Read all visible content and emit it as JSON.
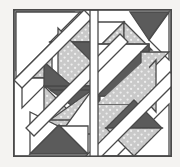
{
  "artwork": {
    "title": "Geometric patchwork quilt block",
    "type": "abstract-geometric-tiling",
    "canvas": {
      "width": 180,
      "height": 167
    },
    "background_color": "#f4f3f1",
    "frame": {
      "x": 13,
      "y": 9,
      "width": 159,
      "height": 148,
      "fill": "#ffffff",
      "stroke": "#4a4a4a",
      "stroke_width": 1.6
    },
    "palette": {
      "white": "#ffffff",
      "speckled_gray": "#c9c9c9",
      "speckle_dot": "#f0f0f0",
      "dark_gray": "#5b5b5b",
      "outline": "#4a4a4a",
      "background": "#f4f3f1"
    },
    "shapes": [
      {
        "id": "s01",
        "name": "top-left-corner-white-triangle",
        "fill": "white",
        "points": "18,14 74,14 18,70"
      },
      {
        "id": "s02",
        "name": "upper-left-speckled-triangle",
        "fill": "speckled",
        "points": "22,76 50,48 50,76"
      },
      {
        "id": "s03",
        "name": "upper-left-white-triangle",
        "fill": "white",
        "points": "22,76 50,76 22,104"
      },
      {
        "id": "s04",
        "name": "top-diamond-speckled-upper",
        "fill": "speckled",
        "points": "80,13 108,41 52,41"
      },
      {
        "id": "s05",
        "name": "top-diamond-dark-lower",
        "fill": "dark",
        "points": "52,41 108,41 80,69"
      },
      {
        "id": "s06",
        "name": "top-center-speckled-triangle",
        "fill": "speckled",
        "points": "98,48 126,20 126,48"
      },
      {
        "id": "s07",
        "name": "top-center-white-wedge",
        "fill": "white",
        "points": "98,48 126,48 98,20"
      },
      {
        "id": "s08",
        "name": "top-right-dark-triangle",
        "fill": "dark",
        "points": "131,13 167,13 149,40"
      },
      {
        "id": "s09",
        "name": "top-right-white-triangle",
        "fill": "white",
        "points": "149,40 167,13 167,58"
      },
      {
        "id": "s10",
        "name": "right-upper-speckled-triangle",
        "fill": "speckled",
        "points": "141,50 167,50 141,76"
      },
      {
        "id": "s11",
        "name": "center-left-speckled-triangle",
        "fill": "speckled",
        "points": "58,83 114,83 58,27"
      },
      {
        "id": "s12",
        "name": "center-left-dark-band",
        "fill": "dark",
        "points": "44,83 100,83 100,110"
      },
      {
        "id": "s13",
        "name": "center-lower-speckled-triangle",
        "fill": "speckled",
        "points": "44,83 44,122 83,122"
      },
      {
        "id": "s14",
        "name": "center-block-white-half",
        "fill": "white",
        "points": "99,44 148,44 99,93"
      },
      {
        "id": "s15",
        "name": "center-block-dark-half",
        "fill": "dark",
        "points": "99,93 148,44 148,93"
      },
      {
        "id": "s16",
        "name": "right-mid-speckled-triangle",
        "fill": "speckled",
        "points": "155,60 155,110 134,85"
      },
      {
        "id": "s17",
        "name": "lower-right-speckled-band",
        "fill": "speckled",
        "points": "99,100 148,100 99,149"
      },
      {
        "id": "s18",
        "name": "lower-right-diamond-dark",
        "fill": "dark",
        "points": "106,126 134,98 162,126"
      },
      {
        "id": "s19",
        "name": "lower-right-diamond-speckled",
        "fill": "speckled",
        "points": "106,126 162,126 134,154"
      },
      {
        "id": "s20",
        "name": "bottom-left-dark-triangle",
        "fill": "dark",
        "points": "32,152 88,152 60,124"
      },
      {
        "id": "s21",
        "name": "bottom-left-white-triangle",
        "fill": "white",
        "points": "32,152 32,110 60,124"
      },
      {
        "id": "s22",
        "name": "lower-left-dark-wedge",
        "fill": "dark",
        "points": "50,88 92,88 92,118"
      },
      {
        "id": "s23",
        "name": "lower-left-speckled-wedge",
        "fill": "speckled",
        "points": "50,88 92,118 58,128"
      },
      {
        "id": "s24",
        "name": "bottom-right-white-panel",
        "fill": "white",
        "points": "95,152 167,152 167,108"
      }
    ],
    "lines": [
      {
        "id": "l01",
        "name": "main-diagonal-top-left",
        "x1": 18,
        "y1": 76,
        "x2": 80,
        "y2": 13
      },
      {
        "id": "l02",
        "name": "main-diagonal-center",
        "x1": 30,
        "y1": 122,
        "x2": 118,
        "y2": 34
      },
      {
        "id": "l03",
        "name": "main-diagonal-bottom-right",
        "x1": 88,
        "y1": 155,
        "x2": 170,
        "y2": 74
      }
    ]
  }
}
